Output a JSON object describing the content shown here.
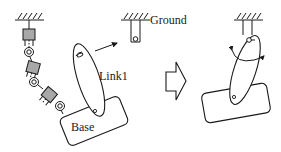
{
  "diagram": {
    "type": "mechanism-schematic",
    "colors": {
      "stroke": "#1a1a1a",
      "joint_fill": "#a8a8a8",
      "background": "#ffffff"
    },
    "left_panel": {
      "labels": {
        "link": "Link1",
        "base": "Base"
      },
      "chain": {
        "prismatic_joints": 3,
        "revolute_joints": 3
      }
    },
    "ground_fixture": {
      "label": "Ground"
    },
    "transition_arrow": "hollow-right-arrow",
    "right_panel": {
      "description": "Link1 pinned to ground, base attached, rotation indicated"
    }
  }
}
